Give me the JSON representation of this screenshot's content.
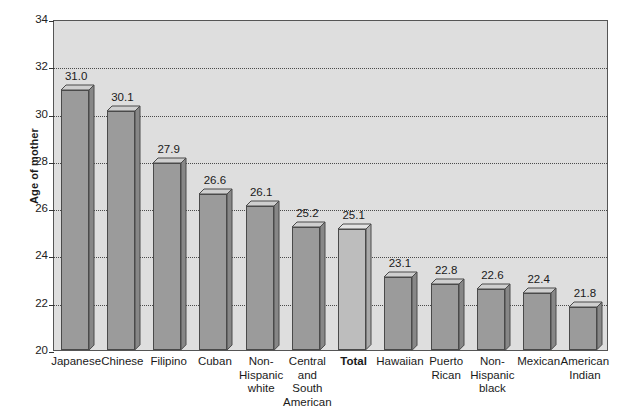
{
  "chart_data": {
    "type": "bar",
    "title": "",
    "subtitle": "",
    "xlabel": "",
    "ylabel": "Age of mother",
    "ylim": [
      20,
      34
    ],
    "ytick_step": 2,
    "yticks": [
      "34",
      "32",
      "30",
      "28",
      "26",
      "24",
      "22",
      "20"
    ],
    "grid": true,
    "legend": "none",
    "style": "3d-bars",
    "highlight_category": "Total",
    "categories": [
      "Japanese",
      "Chinese",
      "Filipino",
      "Cuban",
      "Non-\nHispanic\nwhite",
      "Central\nand\nSouth\nAmerican",
      "Total",
      "Hawaiian",
      "Puerto\nRican",
      "Non-\nHispanic\nblack",
      "Mexican",
      "American\nIndian"
    ],
    "values": [
      31.0,
      30.1,
      27.9,
      26.6,
      26.1,
      25.2,
      25.1,
      23.1,
      22.8,
      22.6,
      22.4,
      21.8
    ],
    "value_labels": [
      "31.0",
      "30.1",
      "27.9",
      "26.6",
      "26.1",
      "25.2",
      "25.1",
      "23.1",
      "22.8",
      "22.6",
      "22.4",
      "21.8"
    ],
    "bars": [
      {
        "label": "Japanese",
        "label_lines": [
          "Japanese"
        ],
        "value": 31.0,
        "value_label": "31.0",
        "highlight": false
      },
      {
        "label": "Chinese",
        "label_lines": [
          "Chinese"
        ],
        "value": 30.1,
        "value_label": "30.1",
        "highlight": false
      },
      {
        "label": "Filipino",
        "label_lines": [
          "Filipino"
        ],
        "value": 27.9,
        "value_label": "27.9",
        "highlight": false
      },
      {
        "label": "Cuban",
        "label_lines": [
          "Cuban"
        ],
        "value": 26.6,
        "value_label": "26.6",
        "highlight": false
      },
      {
        "label": "Non-Hispanic white",
        "label_lines": [
          "Non-",
          "Hispanic",
          "white"
        ],
        "value": 26.1,
        "value_label": "26.1",
        "highlight": false
      },
      {
        "label": "Central and South American",
        "label_lines": [
          "Central",
          "and",
          "South",
          "American"
        ],
        "value": 25.2,
        "value_label": "25.2",
        "highlight": false
      },
      {
        "label": "Total",
        "label_lines": [
          "Total"
        ],
        "value": 25.1,
        "value_label": "25.1",
        "highlight": true
      },
      {
        "label": "Hawaiian",
        "label_lines": [
          "Hawaiian"
        ],
        "value": 23.1,
        "value_label": "23.1",
        "highlight": false
      },
      {
        "label": "Puerto Rican",
        "label_lines": [
          "Puerto",
          "Rican"
        ],
        "value": 22.8,
        "value_label": "22.8",
        "highlight": false
      },
      {
        "label": "Non-Hispanic black",
        "label_lines": [
          "Non-",
          "Hispanic",
          "black"
        ],
        "value": 22.6,
        "value_label": "22.6",
        "highlight": false
      },
      {
        "label": "Mexican",
        "label_lines": [
          "Mexican"
        ],
        "value": 22.4,
        "value_label": "22.4",
        "highlight": false
      },
      {
        "label": "American Indian",
        "label_lines": [
          "American",
          "Indian"
        ],
        "value": 21.8,
        "value_label": "21.8",
        "highlight": false
      }
    ],
    "colors": {
      "plot_background": "#dedede",
      "bar_front": "#9b9b9b",
      "bar_side": "#878787",
      "bar_top": "#cfcfcf",
      "bar_front_highlight": "#bdbdbd",
      "bar_side_highlight": "#a9a9a9",
      "bar_top_highlight": "#e2e2e2",
      "bar_outline": "#4a4a4a",
      "gridline": "#4a4a4a",
      "axis": "#555555",
      "text": "#1a1a1a",
      "page_background": "#ffffff"
    }
  }
}
